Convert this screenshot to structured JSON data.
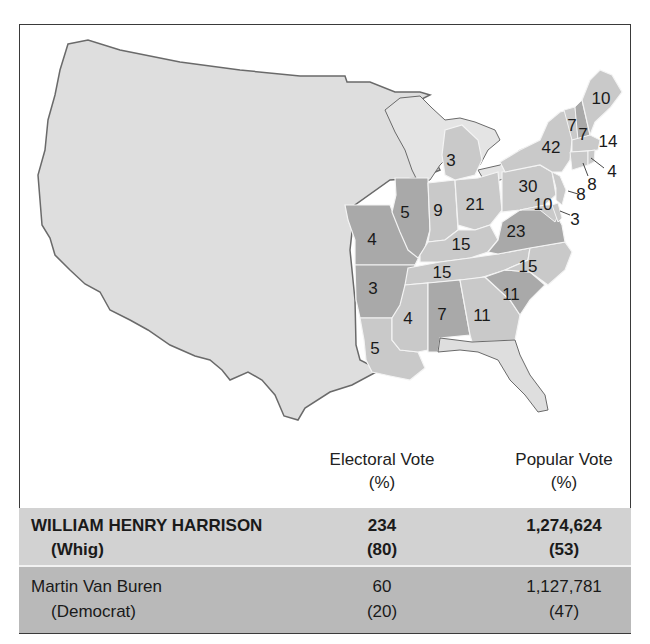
{
  "map": {
    "title_visible": false,
    "colors": {
      "whig": "#c9c9c9",
      "democrat": "#a9a9a9",
      "territory": "#dedede",
      "water": "#e4e4e4",
      "state_border": "#f4f4f4",
      "outline": "#6a6a6a"
    },
    "states": [
      {
        "abbr": "ME",
        "party": "whig",
        "ev": "10"
      },
      {
        "abbr": "NH",
        "party": "democrat",
        "ev": "7"
      },
      {
        "abbr": "VT",
        "party": "whig",
        "ev": "7"
      },
      {
        "abbr": "MA",
        "party": "whig",
        "ev": "14"
      },
      {
        "abbr": "RI",
        "party": "whig",
        "ev": "4"
      },
      {
        "abbr": "CT",
        "party": "whig",
        "ev": "8"
      },
      {
        "abbr": "NY",
        "party": "whig",
        "ev": "42"
      },
      {
        "abbr": "NJ",
        "party": "whig",
        "ev": "8"
      },
      {
        "abbr": "PA",
        "party": "whig",
        "ev": "30"
      },
      {
        "abbr": "MD",
        "party": "whig",
        "ev": "10"
      },
      {
        "abbr": "DE",
        "party": "whig",
        "ev": "3"
      },
      {
        "abbr": "VA",
        "party": "democrat",
        "ev": "23"
      },
      {
        "abbr": "NC",
        "party": "whig",
        "ev": "15"
      },
      {
        "abbr": "SC",
        "party": "democrat",
        "ev": "11"
      },
      {
        "abbr": "GA",
        "party": "whig",
        "ev": "11"
      },
      {
        "abbr": "AL",
        "party": "democrat",
        "ev": "7"
      },
      {
        "abbr": "MS",
        "party": "whig",
        "ev": "4"
      },
      {
        "abbr": "LA",
        "party": "whig",
        "ev": "5"
      },
      {
        "abbr": "TN",
        "party": "whig",
        "ev": "15"
      },
      {
        "abbr": "KY",
        "party": "whig",
        "ev": "15"
      },
      {
        "abbr": "OH",
        "party": "whig",
        "ev": "21"
      },
      {
        "abbr": "IN",
        "party": "whig",
        "ev": "9"
      },
      {
        "abbr": "IL",
        "party": "democrat",
        "ev": "5"
      },
      {
        "abbr": "MI",
        "party": "whig",
        "ev": "3"
      },
      {
        "abbr": "MO",
        "party": "democrat",
        "ev": "4"
      },
      {
        "abbr": "AR",
        "party": "democrat",
        "ev": "3"
      }
    ]
  },
  "results": {
    "headers": {
      "electoral_line1": "Electoral Vote",
      "electoral_line2": "(%)",
      "popular_line1": "Popular Vote",
      "popular_line2": "(%)"
    },
    "candidates": [
      {
        "name": "WILLIAM HENRY HARRISON",
        "party": "(Whig)",
        "electoral": "234",
        "electoral_pct": "(80)",
        "popular": "1,274,624",
        "popular_pct": "(53)",
        "winner": true,
        "row_color": "#d2d2d2"
      },
      {
        "name": "Martin Van Buren",
        "party": "(Democrat)",
        "electoral": "60",
        "electoral_pct": "(20)",
        "popular": "1,127,781",
        "popular_pct": "(47)",
        "winner": false,
        "row_color": "#b9b9b9"
      }
    ]
  }
}
